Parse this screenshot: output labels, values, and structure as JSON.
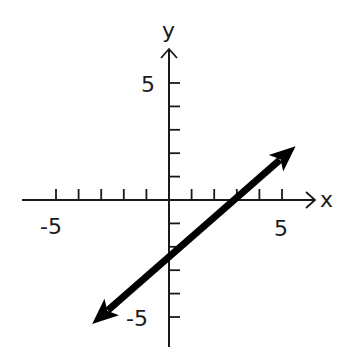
{
  "chart_data": {
    "type": "line",
    "title": "",
    "xlabel": "x",
    "ylabel": "y",
    "xlim": [
      -7,
      7
    ],
    "ylim": [
      -6.5,
      7
    ],
    "grid": false,
    "x_ticks": [
      -5,
      -4,
      -3,
      -2,
      -1,
      1,
      2,
      3,
      4,
      5
    ],
    "y_ticks": [
      -5,
      -4,
      -3,
      -2,
      -1,
      1,
      2,
      3,
      4,
      5
    ],
    "x_tick_labels": [
      {
        "value": -5,
        "label": "-5"
      },
      {
        "value": 5,
        "label": "5"
      }
    ],
    "y_tick_labels": [
      {
        "value": 5,
        "label": "5"
      },
      {
        "value": -5,
        "label": "-5"
      }
    ],
    "series": [
      {
        "name": "line",
        "equation": "y = 0.75x - 2.25",
        "slope": 0.75,
        "y_intercept": -2.25,
        "x_intercept": 3,
        "x": [
          -3.4,
          5.6
        ],
        "y": [
          -5.3,
          2.3
        ],
        "arrows_both_ends": true,
        "color": "#000000"
      }
    ]
  },
  "labels": {
    "x_axis": "x",
    "y_axis": "y",
    "x_neg5": "-5",
    "x_pos5": "5",
    "y_pos5": "5",
    "y_neg5": "-5"
  }
}
